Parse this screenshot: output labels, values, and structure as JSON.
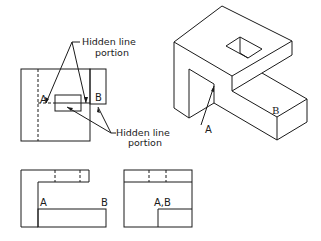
{
  "figure": {
    "type": "orthographic-and-isometric-projection",
    "line_color": "#1a1a1a",
    "background": "#ffffff"
  },
  "annotations": {
    "top_note": {
      "line1": "Hidden line",
      "line2": "portion"
    },
    "bottom_note": {
      "line1": "Hidden line",
      "line2": "portion"
    }
  },
  "views": {
    "top_view": {
      "label_a": "A",
      "label_b": "B"
    },
    "front_view": {
      "label_a": "A",
      "label_b": "B"
    },
    "side_view": {
      "label_ab": "A,B"
    },
    "isometric_view": {
      "label_a": "A",
      "label_b": "B"
    }
  }
}
